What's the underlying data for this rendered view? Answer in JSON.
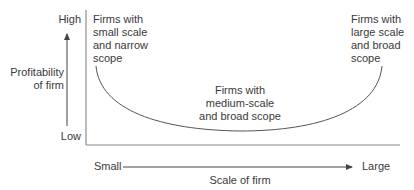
{
  "diagram": {
    "type": "u-curve",
    "y_axis": {
      "title_lines": [
        "Profitability",
        "of firm"
      ],
      "high_label": "High",
      "low_label": "Low"
    },
    "x_axis": {
      "title": "Scale of firm",
      "small_label": "Small",
      "large_label": "Large"
    },
    "annotations": {
      "left": [
        "Firms with",
        "small scale",
        "and narrow",
        "scope"
      ],
      "middle": [
        "Firms with",
        "medium-scale",
        "and broad scope"
      ],
      "right": [
        "Firms with",
        "large scale",
        "and broad",
        "scope"
      ]
    },
    "colors": {
      "line": "#555555",
      "text": "#3a3a3a"
    }
  }
}
